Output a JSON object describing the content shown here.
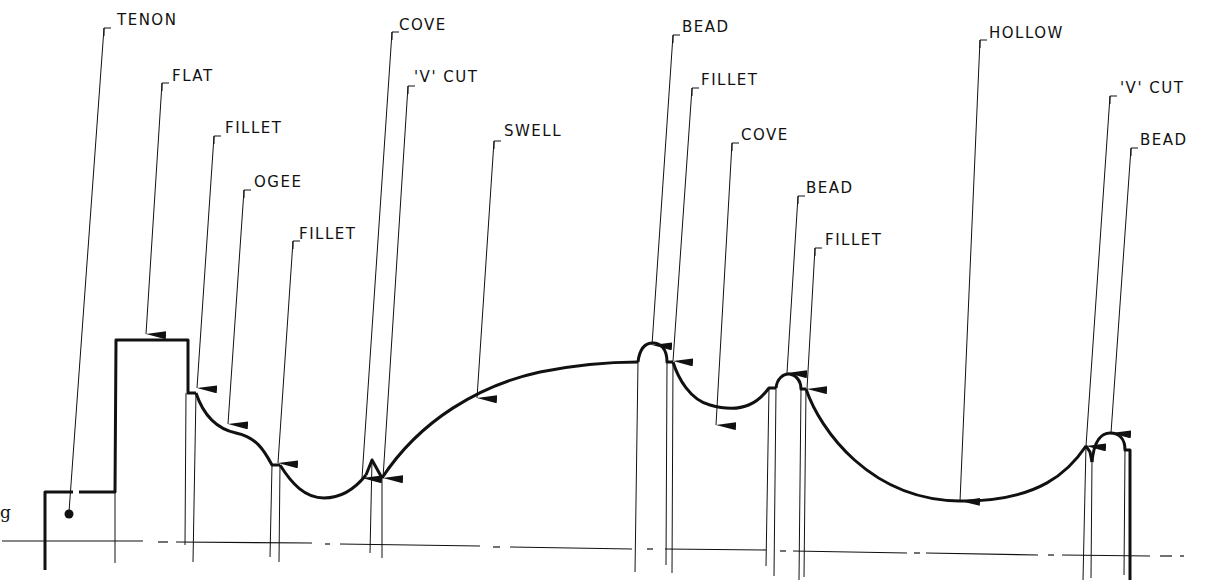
{
  "diagram": {
    "caption_fragment": "g",
    "colors": {
      "line": "#111111",
      "background": "#ffffff"
    },
    "labels": [
      {
        "id": "tenon",
        "text": "TENON",
        "x": 117,
        "y": 20,
        "leader_top": [
          104,
          28
        ],
        "leader_end": [
          69,
          512
        ],
        "end": "dot"
      },
      {
        "id": "flat",
        "text": "FLAT",
        "x": 172,
        "y": 76,
        "leader_top": [
          162,
          83
        ],
        "leader_end": [
          146,
          334
        ],
        "end": "arrow"
      },
      {
        "id": "fillet1",
        "text": "FILLET",
        "x": 225,
        "y": 128,
        "leader_top": [
          214,
          136
        ],
        "leader_end": [
          197,
          388
        ],
        "end": "arrow"
      },
      {
        "id": "ogee",
        "text": "OGEE",
        "x": 254,
        "y": 182,
        "leader_top": [
          244,
          190
        ],
        "leader_end": [
          228,
          424
        ],
        "end": "arrow"
      },
      {
        "id": "fillet2",
        "text": "FILLET",
        "x": 299,
        "y": 234,
        "leader_top": [
          293,
          241
        ],
        "leader_end": [
          278,
          463
        ],
        "end": "arrow"
      },
      {
        "id": "cove1",
        "text": "COVE",
        "x": 399,
        "y": 25,
        "leader_top": [
          392,
          32
        ],
        "leader_end": [
          362,
          478
        ],
        "end": "arrow"
      },
      {
        "id": "vcut1",
        "text": "'V' CUT",
        "x": 414,
        "y": 77,
        "leader_top": [
          408,
          86
        ],
        "leader_end": [
          383,
          478
        ],
        "end": "arrow"
      },
      {
        "id": "swell",
        "text": "SWELL",
        "x": 504,
        "y": 131,
        "leader_top": [
          494,
          141
        ],
        "leader_end": [
          477,
          398
        ],
        "end": "arrow"
      },
      {
        "id": "bead1",
        "text": "BEAD",
        "x": 682,
        "y": 27,
        "leader_top": [
          673,
          35
        ],
        "leader_end": [
          652,
          345
        ],
        "end": "arrow"
      },
      {
        "id": "fillet3",
        "text": "FILLET",
        "x": 701,
        "y": 80,
        "leader_top": [
          692,
          88
        ],
        "leader_end": [
          673,
          361
        ],
        "end": "arrow"
      },
      {
        "id": "cove2",
        "text": "COVE",
        "x": 741,
        "y": 135,
        "leader_top": [
          732,
          143
        ],
        "leader_end": [
          716,
          425
        ],
        "end": "arrow"
      },
      {
        "id": "bead2",
        "text": "BEAD",
        "x": 806,
        "y": 188,
        "leader_top": [
          798,
          196
        ],
        "leader_end": [
          787,
          373
        ],
        "end": "arrow"
      },
      {
        "id": "fillet4",
        "text": "FILLET",
        "x": 825,
        "y": 240,
        "leader_top": [
          815,
          248
        ],
        "leader_end": [
          807,
          389
        ],
        "end": "arrow"
      },
      {
        "id": "hollow",
        "text": "HOLLOW",
        "x": 989,
        "y": 33,
        "leader_top": [
          980,
          40
        ],
        "leader_end": [
          960,
          501
        ],
        "end": "arrow"
      },
      {
        "id": "vcut2",
        "text": "'V' CUT",
        "x": 1120,
        "y": 88,
        "leader_top": [
          1110,
          96
        ],
        "leader_end": [
          1086,
          446
        ],
        "end": "arrow"
      },
      {
        "id": "bead3",
        "text": "BEAD",
        "x": 1140,
        "y": 140,
        "leader_top": [
          1131,
          148
        ],
        "leader_end": [
          1111,
          433
        ],
        "end": "arrow"
      }
    ],
    "centerline_y": 545
  }
}
